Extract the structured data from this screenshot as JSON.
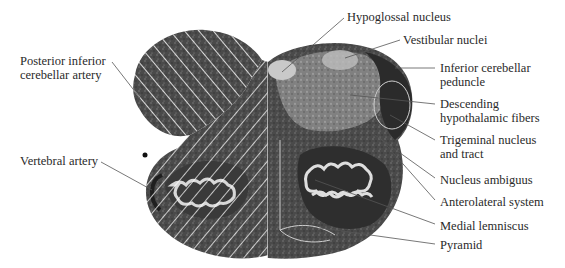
{
  "figure": {
    "left_labels": [
      {
        "id": "pica",
        "lines": [
          "Posterior inferior",
          "cerebellar artery"
        ],
        "x": 20,
        "y": 54
      },
      {
        "id": "vertebral",
        "lines": [
          "Vertebral artery"
        ],
        "x": 20,
        "y": 154
      }
    ],
    "right_labels": [
      {
        "id": "hypoglossal",
        "lines": [
          "Hypoglossal nucleus"
        ],
        "x": 347,
        "y": 12
      },
      {
        "id": "vestibular",
        "lines": [
          "Vestibular nuclei"
        ],
        "x": 403,
        "y": 35
      },
      {
        "id": "icp",
        "lines": [
          "Inferior cerebellar",
          "peduncle"
        ],
        "x": 440,
        "y": 62
      },
      {
        "id": "dhf",
        "lines": [
          "Descending",
          "hypothalamic fibers"
        ],
        "x": 440,
        "y": 98
      },
      {
        "id": "trigeminal",
        "lines": [
          "Trigeminal nucleus",
          "and tract"
        ],
        "x": 440,
        "y": 134
      },
      {
        "id": "ambiguus",
        "lines": [
          "Nucleus ambiguus"
        ],
        "x": 440,
        "y": 175
      },
      {
        "id": "anterolateral",
        "lines": [
          "Anterolateral system"
        ],
        "x": 440,
        "y": 197
      },
      {
        "id": "medial_lemniscus",
        "lines": [
          "Medial lemniscus"
        ],
        "x": 440,
        "y": 221
      },
      {
        "id": "pyramid",
        "lines": [
          "Pyramid"
        ],
        "x": 440,
        "y": 240
      }
    ],
    "colors": {
      "tissue_dark": "#3a3a3a",
      "tissue_mid": "#6b6b6b",
      "tissue_light": "#bdbdbd",
      "hatch": "#ffffff",
      "leader": "#555555",
      "text": "#2a2a2a"
    }
  }
}
